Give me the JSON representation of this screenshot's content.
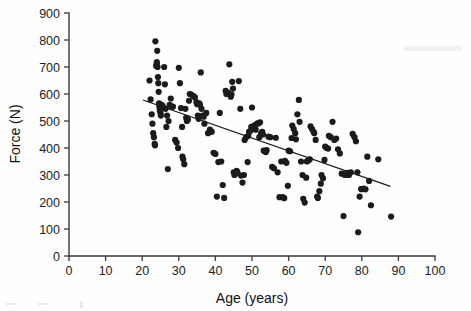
{
  "figure": {
    "name": "age-vs-force-scatter",
    "background_color": "#fefefe",
    "point_color": "#1b1b1b",
    "line_color": "#1b1b1b",
    "axis_color": "#3a3a3a"
  },
  "chart_data": {
    "type": "scatter",
    "title": "",
    "xlabel": "Age (years)",
    "ylabel": "Force (N)",
    "xlim": [
      0,
      100
    ],
    "ylim": [
      0,
      900
    ],
    "xticks": [
      0,
      10,
      20,
      30,
      40,
      50,
      60,
      70,
      80,
      90,
      100
    ],
    "yticks": [
      0,
      100,
      200,
      300,
      400,
      500,
      600,
      700,
      800,
      900
    ],
    "xtick_labels": [
      "0",
      "10",
      "20",
      "30",
      "40",
      "50",
      "60",
      "70",
      "80",
      "90",
      "100"
    ],
    "ytick_labels": [
      "0",
      "100",
      "200",
      "300",
      "400",
      "500",
      "600",
      "700",
      "800",
      "900"
    ],
    "grid": false,
    "legend": null,
    "legend_position": "none",
    "point_marker": "filled-circle",
    "point_size_px": 3.1,
    "n_points": 196,
    "trendline": {
      "type": "linear-regression",
      "x_start": 20.2,
      "y_start": 578,
      "x_end": 87.8,
      "y_end": 258,
      "slope": -4.73,
      "intercept": 673,
      "visible": true
    },
    "x": [
      22.0,
      22.3,
      22.6,
      22.8,
      23.0,
      23.2,
      23.4,
      23.5,
      23.6,
      23.8,
      24.0,
      24.0,
      24.1,
      24.2,
      24.3,
      24.4,
      24.5,
      24.6,
      24.7,
      24.8,
      25.0,
      25.1,
      25.3,
      25.5,
      25.6,
      25.8,
      26.0,
      26.2,
      26.4,
      26.6,
      26.8,
      27.0,
      27.2,
      27.5,
      27.8,
      28.0,
      28.4,
      29.0,
      29.4,
      29.8,
      30.0,
      30.3,
      30.6,
      30.9,
      31.0,
      31.2,
      31.5,
      31.8,
      32.0,
      32.2,
      32.5,
      32.8,
      33.0,
      33.4,
      34.0,
      34.4,
      34.8,
      35.0,
      35.2,
      35.4,
      35.6,
      35.8,
      36.0,
      36.2,
      36.5,
      36.8,
      37.0,
      37.5,
      38.0,
      38.5,
      39.0,
      39.5,
      40.0,
      40.4,
      40.8,
      41.2,
      41.6,
      42.0,
      42.4,
      42.8,
      43.0,
      43.4,
      43.8,
      44.0,
      44.2,
      44.4,
      44.6,
      44.8,
      45.0,
      45.2,
      45.5,
      45.8,
      46.0,
      46.4,
      46.8,
      47.0,
      47.4,
      47.8,
      48.0,
      48.4,
      48.8,
      49.0,
      49.2,
      49.5,
      49.8,
      50.0,
      50.4,
      50.8,
      51.0,
      51.4,
      51.8,
      52.0,
      52.2,
      52.5,
      52.8,
      53.0,
      53.2,
      53.5,
      53.8,
      54.0,
      54.5,
      55.0,
      55.5,
      56.0,
      56.5,
      57.0,
      57.5,
      58.0,
      58.4,
      58.8,
      59.0,
      59.4,
      59.8,
      60.0,
      60.4,
      60.8,
      61.0,
      61.4,
      61.8,
      62.0,
      62.4,
      62.8,
      63.0,
      63.4,
      63.8,
      64.0,
      64.4,
      64.8,
      65.0,
      65.2,
      65.5,
      65.8,
      66.0,
      66.4,
      66.8,
      67.0,
      67.4,
      67.8,
      68.0,
      68.4,
      68.8,
      69.0,
      69.4,
      69.8,
      70.0,
      70.4,
      70.8,
      71.0,
      71.5,
      72.0,
      72.5,
      73.0,
      73.5,
      74.0,
      74.5,
      75.0,
      75.4,
      75.8,
      76.0,
      76.5,
      77.0,
      77.5,
      78.0,
      78.4,
      78.8,
      79.0,
      79.4,
      79.8,
      80.0,
      80.5,
      81.0,
      81.5,
      82.0,
      82.5,
      84.5,
      88.0
    ],
    "y": [
      650,
      580,
      525,
      490,
      455,
      440,
      415,
      410,
      795,
      705,
      712,
      718,
      760,
      700,
      663,
      640,
      608,
      565,
      552,
      538,
      530,
      520,
      560,
      556,
      553,
      548,
      700,
      636,
      545,
      478,
      520,
      322,
      500,
      560,
      583,
      553,
      553,
      430,
      420,
      400,
      697,
      640,
      548,
      478,
      368,
      358,
      340,
      545,
      512,
      500,
      505,
      575,
      600,
      598,
      592,
      588,
      570,
      562,
      520,
      508,
      565,
      560,
      680,
      545,
      520,
      516,
      490,
      530,
      455,
      468,
      460,
      382,
      378,
      220,
      348,
      530,
      350,
      263,
      215,
      612,
      600,
      605,
      710,
      598,
      590,
      598,
      645,
      620,
      310,
      300,
      305,
      315,
      310,
      648,
      545,
      298,
      272,
      300,
      430,
      440,
      348,
      445,
      460,
      463,
      478,
      550,
      480,
      485,
      468,
      490,
      492,
      440,
      495,
      455,
      460,
      450,
      390,
      388,
      385,
      392,
      442,
      440,
      330,
      325,
      438,
      310,
      218,
      350,
      218,
      214,
      352,
      345,
      260,
      390,
      388,
      437,
      483,
      470,
      455,
      432,
      525,
      578,
      497,
      350,
      300,
      212,
      198,
      290,
      350,
      352,
      356,
      358,
      480,
      470,
      460,
      455,
      430,
      220,
      215,
      240,
      268,
      300,
      288,
      356,
      405,
      400,
      398,
      445,
      440,
      497,
      430,
      435,
      395,
      380,
      305,
      148,
      300,
      302,
      308,
      300,
      310,
      452,
      440,
      425,
      310,
      88,
      220,
      248,
      248,
      250,
      247,
      368,
      278,
      188,
      358,
      146
    ]
  },
  "annotations": {
    "xaxis_label": "Age (years)",
    "yaxis_label": "Force (N)"
  }
}
